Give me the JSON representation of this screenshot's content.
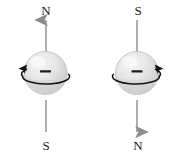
{
  "figure": {
    "background_color": "#ffffff",
    "width": 184,
    "height": 159
  },
  "panels": [
    {
      "id": "left",
      "top_pole_label": "N",
      "bottom_pole_label": "S",
      "axis_arrow_direction": "up",
      "rotation_arrow_side": "left",
      "rotation_sense": "counterclockwise-viewed-from-above",
      "charge_sign": "–"
    },
    {
      "id": "right",
      "top_pole_label": "S",
      "bottom_pole_label": "N",
      "axis_arrow_direction": "down",
      "rotation_arrow_side": "right",
      "rotation_sense": "clockwise-viewed-from-above",
      "charge_sign": "–"
    }
  ],
  "colors": {
    "axis_line": "#9a9a9a",
    "axis_arrow": "#8d8d8d",
    "rotation_arrow": "#111111",
    "sphere_light": "#f2f2f2",
    "sphere_mid": "#dedede",
    "sphere_dark": "#bdbdbd",
    "sphere_outline": "#b5b5b5",
    "charge_sign": "#1d1d1d",
    "label_text": "#1a1a1a",
    "background": "#ffffff"
  }
}
